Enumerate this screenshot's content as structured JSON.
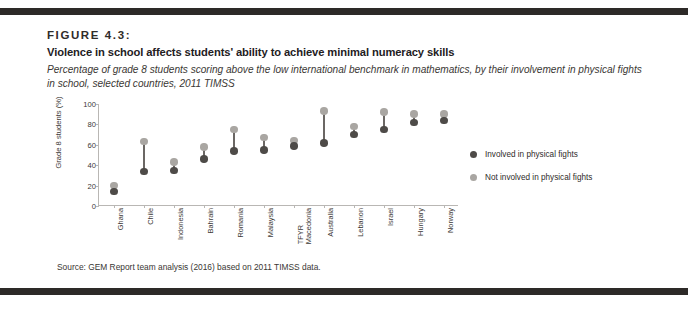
{
  "figure": {
    "label": "FIGURE 4.3:",
    "title": "Violence in school affects students' ability to achieve minimal numeracy skills",
    "subtitle": "Percentage of grade 8 students scoring above the low international benchmark in mathematics, by their involvement in physical fights in school, selected countries, 2011 TIMSS",
    "source": "Source: GEM Report team analysis (2016) based on 2011 TIMSS data."
  },
  "colors": {
    "dark": "#4e4b48",
    "light": "#a9a6a2",
    "connector": "#6b6764",
    "rule": "#2d2a28",
    "axis": "#b9b7b4"
  },
  "legend": {
    "position": "right",
    "entries": [
      {
        "label": "Involved in physical fights",
        "color": "#4e4b48"
      },
      {
        "label": "Not involved in physical fights",
        "color": "#a9a6a2"
      }
    ]
  },
  "chart_data": {
    "type": "scatter",
    "title": "Violence in school affects students' ability to achieve minimal numeracy skills",
    "subtitle": "Percentage of grade 8 students scoring above the low international benchmark in mathematics, by their involvement in physical fights in school, selected countries, 2011 TIMSS",
    "xlabel": "",
    "ylabel": "Grade 8 students (%)",
    "ylim": [
      0,
      100
    ],
    "yticks": [
      0,
      20,
      40,
      60,
      80,
      100
    ],
    "grid": false,
    "legend_position": "right",
    "categories": [
      "Ghana",
      "Chile",
      "Indonesia",
      "Bahrain",
      "Romania",
      "Malaysia",
      "TFYR Macedonia",
      "Australia",
      "Lebanon",
      "Israel",
      "Hungary",
      "Norway"
    ],
    "category_lines": [
      [
        "Ghana"
      ],
      [
        "Chile"
      ],
      [
        "Indonesia"
      ],
      [
        "Bahrain"
      ],
      [
        "Romania"
      ],
      [
        "Malaysia"
      ],
      [
        "TFYR",
        "Macedonia"
      ],
      [
        "Australia"
      ],
      [
        "Lebanon"
      ],
      [
        "Israel"
      ],
      [
        "Hungary"
      ],
      [
        "Norway"
      ]
    ],
    "series": [
      {
        "name": "Involved in physical fights",
        "color": "#4e4b48",
        "values": [
          14,
          34,
          35,
          46,
          54,
          55,
          59,
          62,
          70,
          75,
          82,
          84
        ]
      },
      {
        "name": "Not involved in physical fights",
        "color": "#a9a6a2",
        "values": [
          20,
          63,
          43,
          58,
          75,
          67,
          64,
          93,
          78,
          92,
          90,
          90
        ]
      }
    ]
  }
}
